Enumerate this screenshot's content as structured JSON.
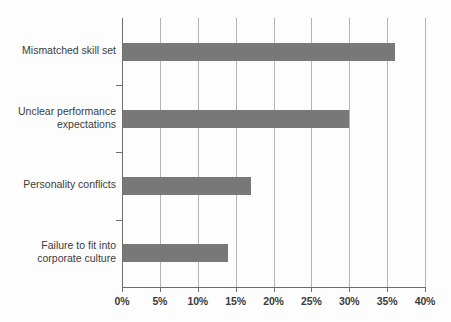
{
  "chart_data": {
    "type": "bar",
    "orientation": "horizontal",
    "title": "",
    "xlabel": "",
    "ylabel": "",
    "categories": [
      "Mismatched skill set",
      "Unclear performance expectations",
      "Personality conflicts",
      "Failure to fit into corporate culture"
    ],
    "category_lines": [
      [
        "Mismatched skill set"
      ],
      [
        "Unclear performance",
        "expectations"
      ],
      [
        "Personality conflicts"
      ],
      [
        "Failure to fit into",
        "corporate culture"
      ]
    ],
    "values": [
      36,
      30,
      17,
      14
    ],
    "value_labels": [
      "36%",
      "30%",
      "17%",
      "14%"
    ],
    "xlim": [
      0,
      40
    ],
    "xticks": [
      0,
      5,
      10,
      15,
      20,
      25,
      30,
      35,
      40
    ],
    "xtick_labels": [
      "0%",
      "5%",
      "10%",
      "15%",
      "20%",
      "25%",
      "30%",
      "35%",
      "40%"
    ],
    "grid": true,
    "grid_axis": "x",
    "legend": false,
    "colors": {
      "bar": "#787878",
      "gridline": "#b4b4b4",
      "axis": "#6e6e6e",
      "text": "#3b3b3b",
      "background": "#fdfdfd"
    }
  }
}
